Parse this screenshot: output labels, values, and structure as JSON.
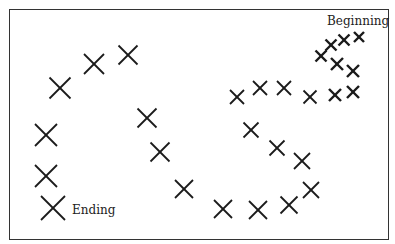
{
  "diagram": {
    "labels": {
      "start": "Beginning",
      "end": "Ending"
    },
    "stroke_color": "#1a1a1a",
    "marks": [
      {
        "x": 359,
        "y": 37,
        "size": 6
      },
      {
        "x": 344,
        "y": 40,
        "size": 7
      },
      {
        "x": 331,
        "y": 45,
        "size": 7
      },
      {
        "x": 321,
        "y": 56,
        "size": 7
      },
      {
        "x": 337,
        "y": 64,
        "size": 8
      },
      {
        "x": 353,
        "y": 71,
        "size": 8
      },
      {
        "x": 353,
        "y": 92,
        "size": 8
      },
      {
        "x": 335,
        "y": 95,
        "size": 8
      },
      {
        "x": 310,
        "y": 97,
        "size": 9
      },
      {
        "x": 284,
        "y": 88,
        "size": 10
      },
      {
        "x": 260,
        "y": 88,
        "size": 10
      },
      {
        "x": 237,
        "y": 97,
        "size": 10
      },
      {
        "x": 251,
        "y": 130,
        "size": 11
      },
      {
        "x": 277,
        "y": 148,
        "size": 11
      },
      {
        "x": 302,
        "y": 161,
        "size": 12
      },
      {
        "x": 311,
        "y": 190,
        "size": 12
      },
      {
        "x": 289,
        "y": 205,
        "size": 13
      },
      {
        "x": 258,
        "y": 210,
        "size": 14
      },
      {
        "x": 223,
        "y": 209,
        "size": 14
      },
      {
        "x": 184,
        "y": 189,
        "size": 14
      },
      {
        "x": 160,
        "y": 152,
        "size": 15
      },
      {
        "x": 147,
        "y": 118,
        "size": 15
      },
      {
        "x": 128,
        "y": 55,
        "size": 15
      },
      {
        "x": 94,
        "y": 64,
        "size": 16
      },
      {
        "x": 60,
        "y": 88,
        "size": 17
      },
      {
        "x": 46,
        "y": 135,
        "size": 18
      },
      {
        "x": 46,
        "y": 176,
        "size": 18
      },
      {
        "x": 53,
        "y": 208,
        "size": 20
      }
    ]
  }
}
